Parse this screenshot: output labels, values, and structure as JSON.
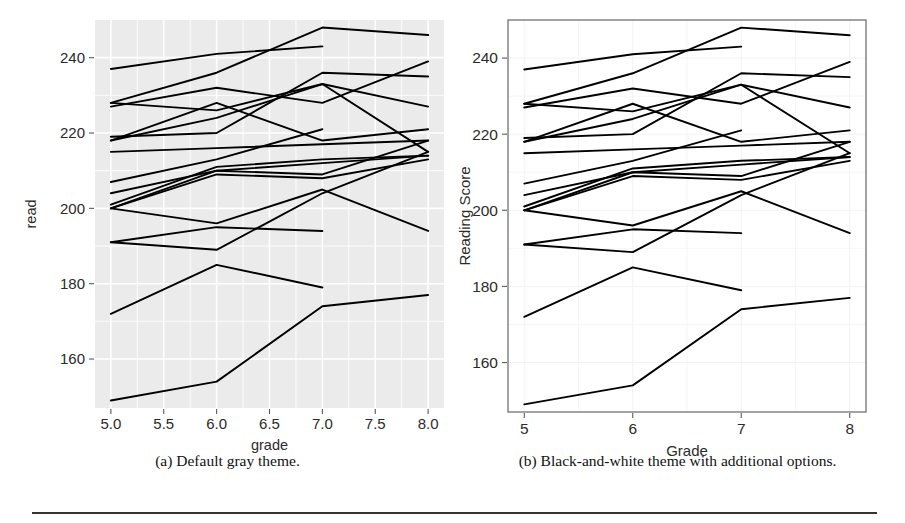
{
  "figure": {
    "caption_a": "(a) Default gray theme.",
    "caption_b": "(b) Black-and-white theme with additional options."
  },
  "chart_data": [
    {
      "id": "panel-a",
      "type": "line",
      "title": "",
      "xlabel": "grade",
      "ylabel": "read",
      "theme": "default gray",
      "panel_fill": "#ebebeb",
      "gridline_color": "#ffffff",
      "line_color": "#000000",
      "grid": true,
      "legend": "none",
      "xlim": [
        4.85,
        8.15
      ],
      "ylim": [
        147,
        250
      ],
      "xticks": [
        "5.0",
        "5.5",
        "6.0",
        "6.5",
        "7.0",
        "7.5",
        "8.0"
      ],
      "xtick_values": [
        5.0,
        5.5,
        6.0,
        6.5,
        7.0,
        7.5,
        8.0
      ],
      "yticks": [
        "160",
        "180",
        "200",
        "220",
        "240"
      ],
      "ytick_values": [
        160,
        180,
        200,
        220,
        240
      ],
      "x": [
        5,
        6,
        7,
        8
      ],
      "series": [
        {
          "name": "id-01",
          "values": [
            237,
            241,
            243,
            null
          ]
        },
        {
          "name": "id-02",
          "values": [
            228,
            236,
            248,
            246
          ]
        },
        {
          "name": "id-03",
          "values": [
            228,
            226,
            233,
            227
          ]
        },
        {
          "name": "id-04",
          "values": [
            227,
            232,
            228,
            239
          ]
        },
        {
          "name": "id-05",
          "values": [
            219,
            220,
            236,
            235
          ]
        },
        {
          "name": "id-06",
          "values": [
            218,
            224,
            233,
            215
          ]
        },
        {
          "name": "id-07",
          "values": [
            218,
            228,
            218,
            221
          ]
        },
        {
          "name": "id-08",
          "values": [
            215,
            216,
            217,
            218
          ]
        },
        {
          "name": "id-09",
          "values": [
            207,
            213,
            221,
            null
          ]
        },
        {
          "name": "id-10",
          "values": [
            204,
            210,
            212,
            214
          ]
        },
        {
          "name": "id-11",
          "values": [
            201,
            211,
            213,
            214
          ]
        },
        {
          "name": "id-12",
          "values": [
            200,
            209,
            208,
            213
          ]
        },
        {
          "name": "id-13",
          "values": [
            200,
            210,
            209,
            218
          ]
        },
        {
          "name": "id-14",
          "values": [
            200,
            196,
            205,
            194
          ]
        },
        {
          "name": "id-15",
          "values": [
            191,
            195,
            194,
            null
          ]
        },
        {
          "name": "id-16",
          "values": [
            191,
            189,
            204,
            215
          ]
        },
        {
          "name": "id-17",
          "values": [
            172,
            185,
            179,
            null
          ]
        },
        {
          "name": "id-18",
          "values": [
            149,
            154,
            174,
            177
          ]
        }
      ]
    },
    {
      "id": "panel-b",
      "type": "line",
      "title": "",
      "xlabel": "Grade",
      "ylabel": "Reading Score",
      "theme": "black-and-white with additional options",
      "panel_fill": "#ffffff",
      "panel_border_color": "#666666",
      "gridline_color": "#f2f2f2",
      "line_color": "#000000",
      "grid": true,
      "legend": "none",
      "xlim": [
        4.85,
        8.15
      ],
      "ylim": [
        147,
        250
      ],
      "xticks": [
        "5",
        "6",
        "7",
        "8"
      ],
      "xtick_values": [
        5,
        6,
        7,
        8
      ],
      "yticks": [
        "160",
        "180",
        "200",
        "220",
        "240"
      ],
      "ytick_values": [
        160,
        180,
        200,
        220,
        240
      ],
      "x": [
        5,
        6,
        7,
        8
      ],
      "series": [
        {
          "name": "id-01",
          "values": [
            237,
            241,
            243,
            null
          ]
        },
        {
          "name": "id-02",
          "values": [
            228,
            236,
            248,
            246
          ]
        },
        {
          "name": "id-03",
          "values": [
            228,
            226,
            233,
            227
          ]
        },
        {
          "name": "id-04",
          "values": [
            227,
            232,
            228,
            239
          ]
        },
        {
          "name": "id-05",
          "values": [
            219,
            220,
            236,
            235
          ]
        },
        {
          "name": "id-06",
          "values": [
            218,
            224,
            233,
            215
          ]
        },
        {
          "name": "id-07",
          "values": [
            218,
            228,
            218,
            221
          ]
        },
        {
          "name": "id-08",
          "values": [
            215,
            216,
            217,
            218
          ]
        },
        {
          "name": "id-09",
          "values": [
            207,
            213,
            221,
            null
          ]
        },
        {
          "name": "id-10",
          "values": [
            204,
            210,
            212,
            214
          ]
        },
        {
          "name": "id-11",
          "values": [
            201,
            211,
            213,
            214
          ]
        },
        {
          "name": "id-12",
          "values": [
            200,
            209,
            208,
            213
          ]
        },
        {
          "name": "id-13",
          "values": [
            200,
            210,
            209,
            218
          ]
        },
        {
          "name": "id-14",
          "values": [
            200,
            196,
            205,
            194
          ]
        },
        {
          "name": "id-15",
          "values": [
            191,
            195,
            194,
            null
          ]
        },
        {
          "name": "id-16",
          "values": [
            191,
            189,
            204,
            215
          ]
        },
        {
          "name": "id-17",
          "values": [
            172,
            185,
            179,
            null
          ]
        },
        {
          "name": "id-18",
          "values": [
            149,
            154,
            174,
            177
          ]
        }
      ]
    }
  ]
}
